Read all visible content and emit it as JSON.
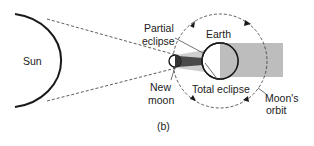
{
  "labels": {
    "sun": "Sun",
    "earth": "Earth",
    "partial_eclipse_1": "Partial",
    "partial_eclipse_2": "eclipse",
    "new_moon_1": "New",
    "new_moon_2": "moon",
    "total_eclipse": "Total eclipse",
    "moons_orbit_1": "Moon's",
    "moons_orbit_2": "orbit",
    "panel": "(b)"
  },
  "colors": {
    "line": "#1a1a1a",
    "shadow": "#b8b8b8",
    "umbra": "#555555"
  }
}
